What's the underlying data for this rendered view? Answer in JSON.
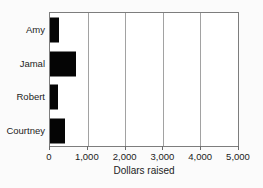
{
  "chart_data": {
    "type": "bar",
    "orientation": "horizontal",
    "title": "",
    "xlabel": "Dollars raised",
    "ylabel": "",
    "categories": [
      "Amy",
      "Jamal",
      "Robert",
      "Courtney"
    ],
    "values": [
      250,
      700,
      200,
      400
    ],
    "xlim": [
      0,
      5000
    ],
    "xticks": [
      0,
      1000,
      2000,
      3000,
      4000,
      5000
    ],
    "xtick_labels": [
      "0",
      "1,000",
      "2,000",
      "3,000",
      "4,000",
      "5,000"
    ],
    "grid": true,
    "legend": false,
    "bar_color": "#050505",
    "gridline_color": "#a2a2a2",
    "border_color": "#7d7d7d",
    "background_color": "#fbfbfb",
    "plot_background_color": "#ffffff",
    "text_color": "#1c1c1c"
  }
}
